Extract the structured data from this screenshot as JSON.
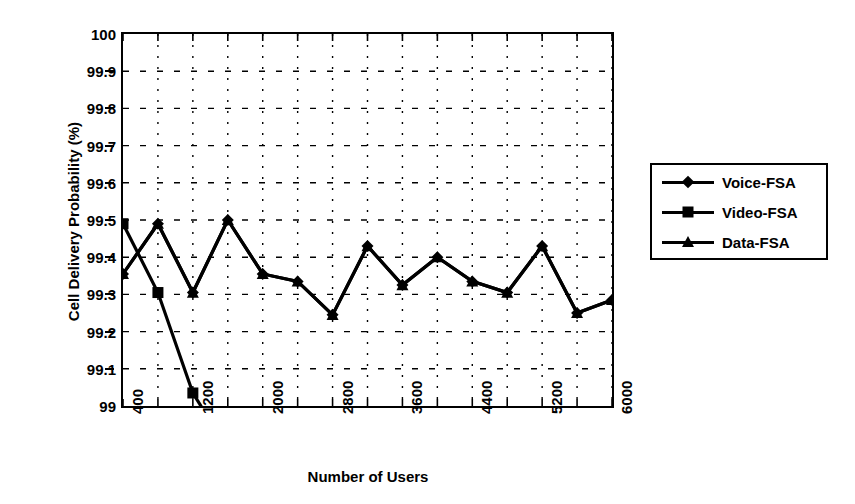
{
  "chart_data": {
    "type": "line",
    "title": "",
    "xlabel": "Number of Users",
    "ylabel": "Cell Delivery Probability (%)",
    "xlim": [
      400,
      6000
    ],
    "ylim": [
      99,
      100
    ],
    "ytick_values": [
      99,
      99.1,
      99.2,
      99.3,
      99.4,
      99.5,
      99.6,
      99.7,
      99.8,
      99.9,
      100
    ],
    "ytick_labels": [
      "99",
      "99.1",
      "99.2",
      "99.3",
      "99.4",
      "99.5",
      "99.6",
      "99.7",
      "99.8",
      "99.9",
      "100"
    ],
    "xtick_values": [
      400,
      800,
      1200,
      1600,
      2000,
      2400,
      2800,
      3200,
      3600,
      4000,
      4400,
      4800,
      5200,
      5600,
      6000
    ],
    "xtick_labels_shown": [
      "400",
      "1200",
      "2000",
      "2800",
      "3600",
      "4400",
      "5200",
      "6000"
    ],
    "xtick_labels_shown_values": [
      400,
      1200,
      2000,
      2800,
      3600,
      4400,
      5200,
      6000
    ],
    "xtick_label_rotation": -90,
    "grid": true,
    "grid_style": "dotted",
    "legend_position": "right-outside",
    "marker_color": "#000000",
    "line_color": "#000000",
    "x": [
      400,
      800,
      1200,
      1600,
      2000,
      2400,
      2800,
      3200,
      3600,
      4000,
      4400,
      4800,
      5200,
      5600,
      6000
    ],
    "series": [
      {
        "name": "Voice-FSA",
        "marker": "diamond",
        "values": [
          99.355,
          99.49,
          99.305,
          99.5,
          99.355,
          99.335,
          99.245,
          99.43,
          99.325,
          99.4,
          99.335,
          99.305,
          99.43,
          99.25,
          99.285
        ]
      },
      {
        "name": "Video-FSA",
        "marker": "square",
        "values": [
          99.49,
          99.305,
          99.035,
          null,
          null,
          null,
          null,
          null,
          null,
          null,
          null,
          null,
          null,
          null,
          null
        ]
      },
      {
        "name": "Data-FSA",
        "marker": "triangle",
        "values": [
          99.355,
          99.49,
          99.305,
          99.5,
          99.355,
          99.335,
          99.245,
          99.43,
          99.325,
          99.4,
          99.335,
          99.305,
          99.43,
          99.25,
          99.285
        ]
      }
    ]
  },
  "legend": {
    "items": [
      {
        "label": "Voice-FSA",
        "marker": "diamond"
      },
      {
        "label": "Video-FSA",
        "marker": "square"
      },
      {
        "label": "Data-FSA",
        "marker": "triangle"
      }
    ]
  }
}
